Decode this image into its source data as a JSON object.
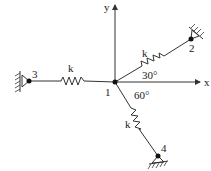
{
  "diagram": {
    "type": "spring system",
    "axes": {
      "x_label": "x",
      "y_label": "y"
    },
    "nodes": [
      {
        "id": "1",
        "label": "1",
        "role": "free node at origin"
      },
      {
        "id": "2",
        "label": "2",
        "role": "fixed support"
      },
      {
        "id": "3",
        "label": "3",
        "role": "fixed support"
      },
      {
        "id": "4",
        "label": "4",
        "role": "fixed support"
      }
    ],
    "springs": [
      {
        "from": "1",
        "to": "3",
        "label": "k"
      },
      {
        "from": "1",
        "to": "2",
        "label": "k"
      },
      {
        "from": "1",
        "to": "4",
        "label": "k"
      }
    ],
    "angles": [
      {
        "label": "30°",
        "description": "spring 1-2 above +x axis"
      },
      {
        "label": "60°",
        "description": "spring 1-4 below +x axis"
      }
    ]
  }
}
